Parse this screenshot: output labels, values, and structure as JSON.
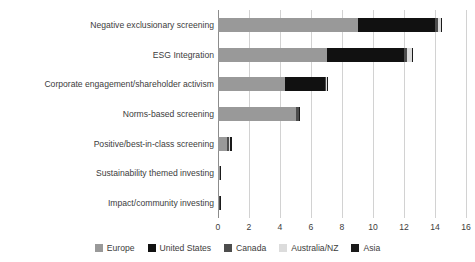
{
  "chart_data": {
    "type": "bar",
    "orientation": "horizontal",
    "stacked": true,
    "title": "",
    "xlabel": "",
    "ylabel": "",
    "xlim": [
      0,
      16
    ],
    "xticks": [
      0,
      2,
      4,
      6,
      8,
      10,
      12,
      14,
      16
    ],
    "grid": true,
    "legend_position": "bottom",
    "categories": [
      "Negative exclusionary screening",
      "ESG Integration",
      "Corporate engagement/shareholder activism",
      "Norms-based screening",
      "Positive/best-in-class screening",
      "Sustainability themed investing",
      "Impact/community investing"
    ],
    "series": [
      {
        "name": "Europe",
        "color": "#999999",
        "values": [
          9.0,
          7.0,
          4.3,
          5.0,
          0.6,
          0.1,
          0.05
        ]
      },
      {
        "name": "United States",
        "color": "#111111",
        "values": [
          5.0,
          5.0,
          2.6,
          0.0,
          0.0,
          0.0,
          0.0
        ]
      },
      {
        "name": "Canada",
        "color": "#4d4d4d",
        "values": [
          0.2,
          0.2,
          0.1,
          0.2,
          0.1,
          0.02,
          0.05
        ]
      },
      {
        "name": "Australia/NZ",
        "color": "#dcdcdc",
        "values": [
          0.2,
          0.3,
          0.05,
          0.05,
          0.05,
          0.02,
          0.02
        ]
      },
      {
        "name": "Asia",
        "color": "#1a1a1a",
        "values": [
          0.05,
          0.05,
          0.05,
          0.05,
          0.15,
          0.02,
          0.02
        ]
      }
    ],
    "totals": [
      14.45,
      12.55,
      7.1,
      5.3,
      0.9,
      0.16,
      0.14
    ]
  },
  "axis": {
    "tick_labels": [
      "0",
      "2",
      "4",
      "6",
      "8",
      "10",
      "12",
      "14",
      "16"
    ]
  },
  "legend": {
    "items": [
      {
        "label": "Europe",
        "color": "#999999"
      },
      {
        "label": "United States",
        "color": "#111111"
      },
      {
        "label": "Canada",
        "color": "#4d4d4d"
      },
      {
        "label": "Australia/NZ",
        "color": "#dcdcdc"
      },
      {
        "label": "Asia",
        "color": "#1a1a1a"
      }
    ]
  }
}
